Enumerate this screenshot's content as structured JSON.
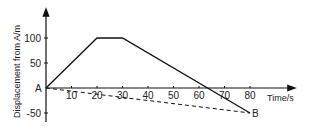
{
  "chart_data": {
    "type": "line",
    "title": "",
    "xlabel": "Time/s",
    "ylabel": "Displacement from A/m",
    "xlim": [
      0,
      90
    ],
    "ylim": [
      -60,
      130
    ],
    "x_ticks": [
      10,
      20,
      30,
      40,
      50,
      60,
      70,
      80
    ],
    "y_ticks": [
      100,
      50,
      -50
    ],
    "origin_label": "A",
    "grid": false,
    "series": [
      {
        "name": "displacement",
        "style": "solid",
        "x": [
          0,
          20,
          30,
          80
        ],
        "y": [
          0,
          100,
          100,
          -50
        ]
      },
      {
        "name": "A-to-B direct",
        "style": "dashed",
        "x": [
          0,
          80
        ],
        "y": [
          0,
          -50
        ]
      }
    ],
    "annotations": [
      {
        "text": "A",
        "x": 0,
        "y": 0
      },
      {
        "text": "B",
        "x": 80,
        "y": -50
      }
    ]
  }
}
